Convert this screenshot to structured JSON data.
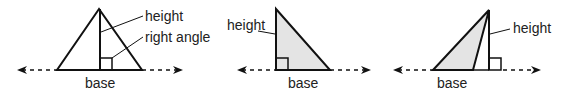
{
  "colors": {
    "stroke": "#111111",
    "fill": "#e4e4e4",
    "background": "#ffffff"
  },
  "figures": [
    {
      "id": "acute",
      "labels": {
        "height": "height",
        "right_angle": "right angle",
        "base": "base"
      }
    },
    {
      "id": "right",
      "labels": {
        "height": "height",
        "base": "base"
      }
    },
    {
      "id": "obtuse",
      "labels": {
        "height": "height",
        "base": "base"
      }
    }
  ]
}
